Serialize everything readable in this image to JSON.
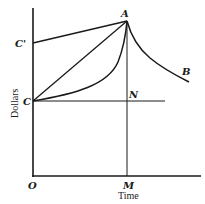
{
  "diagram": {
    "type": "economics-curve-diagram",
    "axes": {
      "x_label": "Time",
      "y_label": "Dollars",
      "origin_label": "O"
    },
    "points": {
      "A": "A",
      "B": "B",
      "C": "C",
      "C_prime": "C'",
      "N": "N",
      "M": "M"
    },
    "elements": [
      {
        "id": "line-c-prime-a",
        "from": "C'",
        "to": "A",
        "kind": "straight"
      },
      {
        "id": "line-c-a",
        "from": "C",
        "to": "A",
        "kind": "straight"
      },
      {
        "id": "curve-c-a",
        "from": "C",
        "to": "A",
        "kind": "convex-curve"
      },
      {
        "id": "curve-a-b",
        "from": "A",
        "to": "B",
        "kind": "decay-curve"
      },
      {
        "id": "line-c-n",
        "from": "C",
        "to": "N",
        "kind": "horizontal"
      },
      {
        "id": "line-a-m",
        "from": "A",
        "to": "M",
        "kind": "vertical"
      }
    ],
    "colors": {
      "ink": "#1a1a1a",
      "background": "#ffffff"
    }
  }
}
